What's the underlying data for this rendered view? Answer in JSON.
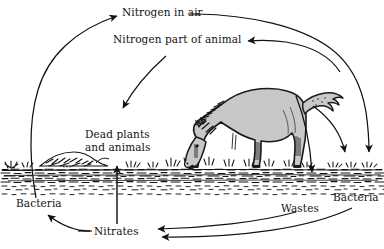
{
  "diagram": {
    "type": "cycle-diagram",
    "background_color": "#ffffff",
    "ink_color": "#121212",
    "animal_fill_color": "#c8c8c8",
    "labels": {
      "nitrogen_in_air": "Nitrogen in air",
      "nitrogen_part_of_animal": "Nitrogen part of animal",
      "dead_plants_line1": "Dead plants",
      "dead_plants_line2": "and animals",
      "bacteria_left": "Bacteria",
      "bacteria_right": "Bacteria",
      "wastes": "Wastes",
      "nitrates": "Nitrates"
    },
    "illustration": {
      "animal": "grazing horse",
      "ground": "soil band with grass tufts",
      "mound": "dead plant and animal debris mound"
    },
    "flows": [
      {
        "from": "Bacteria (left)",
        "to": "Nitrogen in air"
      },
      {
        "from": "Nitrogen in air",
        "to": "Nitrogen part of animal"
      },
      {
        "from": "Nitrogen part of animal",
        "to": "Dead plants and animals"
      },
      {
        "from": "Nitrates",
        "to": "Dead plants and animals"
      },
      {
        "from": "Animal",
        "to": "Wastes"
      },
      {
        "from": "Air",
        "to": "Bacteria (right)"
      },
      {
        "from": "Air",
        "to": "Bacteria (right)"
      },
      {
        "from": "Wastes",
        "to": "Nitrates"
      },
      {
        "from": "Bacteria (right)",
        "to": "Nitrates"
      },
      {
        "from": "Nitrates",
        "to": "Bacteria (left)"
      }
    ]
  }
}
